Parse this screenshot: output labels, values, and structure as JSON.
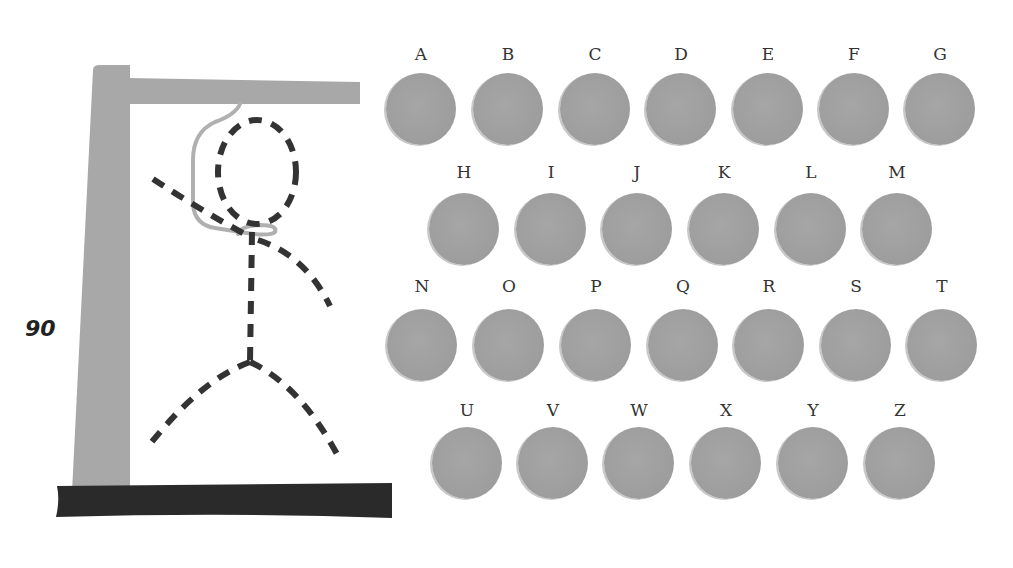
{
  "score": "90",
  "colors": {
    "gallows": "#a8a8a8",
    "base": "#2a2a2a",
    "figure": "#333333",
    "rope": "#b0b0b0",
    "key": "#a0a0a0",
    "label": "#333333"
  },
  "keyboard": {
    "rows": [
      {
        "keys": [
          {
            "letter": "A",
            "x": 421,
            "y": 109
          },
          {
            "letter": "B",
            "x": 508,
            "y": 109
          },
          {
            "letter": "C",
            "x": 595,
            "y": 109
          },
          {
            "letter": "D",
            "x": 681,
            "y": 109
          },
          {
            "letter": "E",
            "x": 768,
            "y": 109
          },
          {
            "letter": "F",
            "x": 854,
            "y": 109
          },
          {
            "letter": "G",
            "x": 940,
            "y": 109
          }
        ],
        "label_y": 44
      },
      {
        "keys": [
          {
            "letter": "H",
            "x": 464,
            "y": 229
          },
          {
            "letter": "I",
            "x": 551,
            "y": 229
          },
          {
            "letter": "J",
            "x": 637,
            "y": 229
          },
          {
            "letter": "K",
            "x": 724,
            "y": 229
          },
          {
            "letter": "L",
            "x": 811,
            "y": 229
          },
          {
            "letter": "M",
            "x": 897,
            "y": 229
          }
        ],
        "label_y": 162
      },
      {
        "keys": [
          {
            "letter": "N",
            "x": 422,
            "y": 345
          },
          {
            "letter": "O",
            "x": 509,
            "y": 345
          },
          {
            "letter": "P",
            "x": 596,
            "y": 345
          },
          {
            "letter": "Q",
            "x": 683,
            "y": 345
          },
          {
            "letter": "R",
            "x": 769,
            "y": 345
          },
          {
            "letter": "S",
            "x": 856,
            "y": 345
          },
          {
            "letter": "T",
            "x": 942,
            "y": 345
          }
        ],
        "label_y": 276
      },
      {
        "keys": [
          {
            "letter": "U",
            "x": 467,
            "y": 463
          },
          {
            "letter": "V",
            "x": 553,
            "y": 463
          },
          {
            "letter": "W",
            "x": 639,
            "y": 463
          },
          {
            "letter": "X",
            "x": 726,
            "y": 463
          },
          {
            "letter": "Y",
            "x": 813,
            "y": 463
          },
          {
            "letter": "Z",
            "x": 900,
            "y": 463
          }
        ],
        "label_y": 400
      }
    ]
  }
}
